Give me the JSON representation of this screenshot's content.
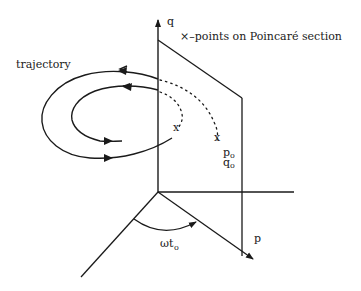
{
  "figure": {
    "type": "poincare-section-diagram",
    "labels": {
      "trajectory": "trajectory",
      "legend": "×–points on Poincaré section",
      "q_axis": "q",
      "p_axis": "p",
      "p0": "p",
      "p0_sub": "o",
      "q0": "q",
      "q0_sub": "o",
      "angle": "ωt",
      "angle_sub": "o"
    },
    "markers": {
      "crossing_symbol": "x"
    },
    "colors": {
      "ink": "#1a1a1a",
      "background": "#ffffff"
    }
  }
}
